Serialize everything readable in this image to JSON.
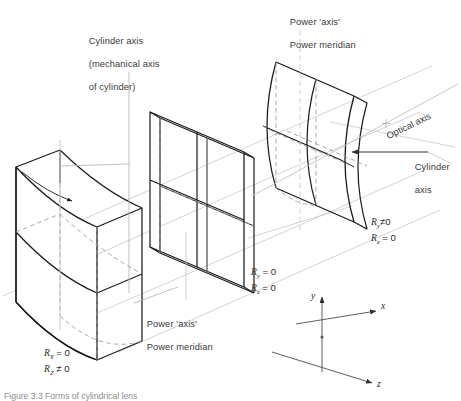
{
  "figure": {
    "domain": "technical-optics-diagram",
    "title_caption": "Figure 3.3 Forms of cylindrical lens",
    "background": "#ffffff",
    "ink_color": "#1a1a1a",
    "construction_color": "#b9b9b9",
    "dash_color": "#9a9a9a"
  },
  "annotations": {
    "cylinder_axis_top": {
      "line1": "Cylinder axis",
      "line2": "(mechanical axis",
      "line3": "of cylinder)"
    },
    "power_axis_top": {
      "line1": "Power 'axis'",
      "line2": "Power meridian"
    },
    "power_axis_bottom": {
      "line1": "Power 'axis'",
      "line2": "Power meridian"
    },
    "optical_axis": "Optical axis",
    "cylinder_axis_right": {
      "line1": "Cylinder",
      "line2": "axis"
    }
  },
  "lenses": [
    {
      "id": "left-lens",
      "name": "plano-cylindrical-lens-vertical-axis",
      "description": "Cylindrical surface curved about a vertical axis",
      "radius_y": {
        "symbol": "R",
        "subscript": "Y",
        "relation": "=",
        "value": "0"
      },
      "radius_z": {
        "symbol": "R",
        "subscript": "Z",
        "relation": "≠",
        "value": "0"
      },
      "label_lines": [
        "R_Y = 0",
        "R_Z ≠ 0"
      ]
    },
    {
      "id": "middle-lens",
      "name": "plano-plano-plate",
      "description": "Flat plane parallel plate, no curvature",
      "radius_y": {
        "symbol": "R",
        "subscript": "y",
        "relation": "=",
        "value": "0"
      },
      "radius_z": {
        "symbol": "R",
        "subscript": "z",
        "relation": "=",
        "value": "0"
      },
      "label_lines": [
        "R_y = 0",
        "R_z = 0"
      ]
    },
    {
      "id": "right-lens",
      "name": "plano-cylindrical-lens-horizontal-axis",
      "description": "Cylindrical surface curved about a horizontal axis",
      "radius_y": {
        "symbol": "R",
        "subscript": "y",
        "relation": "≠",
        "value": "0"
      },
      "radius_z": {
        "symbol": "R",
        "subscript": "z",
        "relation": "=",
        "value": "0"
      },
      "label_lines": [
        "R_y ≠ 0",
        "R_z = 0"
      ]
    }
  ],
  "coordinate_triad": {
    "name": "xyz-axes",
    "axes": [
      {
        "id": "y",
        "label": "y",
        "direction": "up"
      },
      {
        "id": "x",
        "label": "x",
        "direction": "upper-right"
      },
      {
        "id": "z",
        "label": "z",
        "direction": "lower-right"
      }
    ]
  }
}
